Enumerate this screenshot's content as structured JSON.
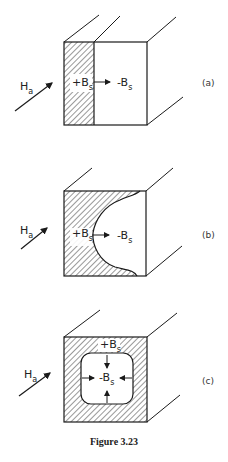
{
  "figure": {
    "caption": "Figure 3.23",
    "panels": [
      {
        "id": "a",
        "tag": "(a)",
        "applied_field": {
          "main": "H",
          "sub": "a"
        },
        "region_positive": {
          "sign": "+B",
          "sub": "s"
        },
        "region_negative": {
          "sign": "-B",
          "sub": "s"
        },
        "description": "Hatched slab on left face, boundary moving right"
      },
      {
        "id": "b",
        "tag": "(b)",
        "applied_field": {
          "main": "H",
          "sub": "a"
        },
        "region_positive": {
          "sign": "+B",
          "sub": "s"
        },
        "region_negative": {
          "sign": "-B",
          "sub": "s"
        },
        "description": "Curved boundary between hatched and clear regions"
      },
      {
        "id": "c",
        "tag": "(c)",
        "applied_field": {
          "main": "H",
          "sub": "a"
        },
        "region_positive": {
          "sign": "+B",
          "sub": "s"
        },
        "region_negative": {
          "sign": "-B",
          "sub": "s"
        },
        "description": "Hatched shell around shrinking rounded-square core"
      }
    ]
  },
  "colors": {
    "line": "#1a1a1a",
    "hatch": "#333333",
    "background": "#ffffff"
  }
}
